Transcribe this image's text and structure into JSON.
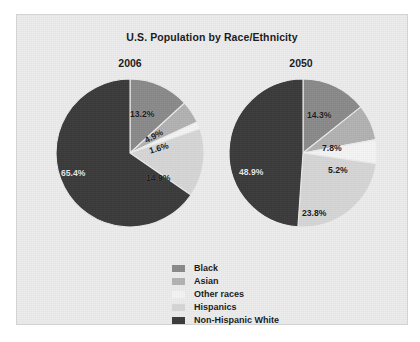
{
  "chart_data": {
    "type": "pie",
    "title": "U.S. Population by Race/Ethnicity",
    "xlabel": "",
    "ylabel": "",
    "legend_position": "bottom-center",
    "grid": false,
    "categories": [
      "Black",
      "Asian",
      "Other races",
      "Hispanics",
      "Non-Hispanic White"
    ],
    "colors": [
      "#8a8a8a",
      "#b2b2b2",
      "#f4f4f4",
      "#d6d6d6",
      "#3b3b3b"
    ],
    "panels": [
      {
        "name": "2006",
        "values": [
          13.2,
          4.9,
          1.6,
          14.9,
          65.4
        ],
        "labels": [
          "13.2%",
          "4.9%",
          "1.6%",
          "14.9%",
          "65.4%"
        ]
      },
      {
        "name": "2050",
        "values": [
          14.3,
          7.8,
          5.2,
          23.8,
          48.9
        ],
        "labels": [
          "14.3%",
          "7.8%",
          "5.2%",
          "23.8%",
          "48.9%"
        ]
      }
    ]
  },
  "chart": {
    "title": "U.S. Population by Race/Ethnicity",
    "panel_2006": {
      "title": "2006",
      "label_black": "13.2%",
      "label_asian": "4.9%",
      "label_other": "1.6%",
      "label_hispanics": "14.9%",
      "label_white": "65.4%"
    },
    "panel_2050": {
      "title": "2050",
      "label_black": "14.3%",
      "label_asian": "7.8%",
      "label_other": "5.2%",
      "label_hispanics": "23.8%",
      "label_white": "48.9%"
    },
    "legend": {
      "items": [
        {
          "label": "Black",
          "color": "#8a8a8a"
        },
        {
          "label": "Asian",
          "color": "#b2b2b2"
        },
        {
          "label": "Other races",
          "color": "#f4f4f4"
        },
        {
          "label": "Hispanics",
          "color": "#d6d6d6"
        },
        {
          "label": "Non-Hispanic White",
          "color": "#3b3b3b"
        }
      ]
    }
  }
}
